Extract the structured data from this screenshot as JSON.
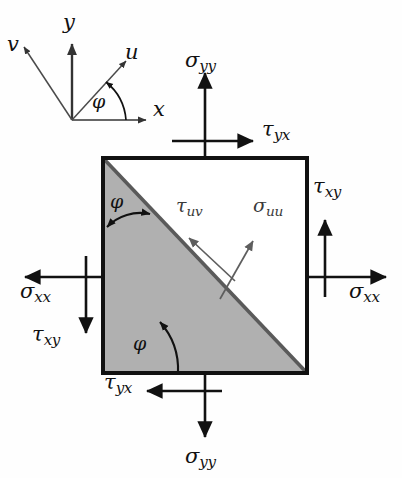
{
  "figure": {
    "type": "stress-element-diagram",
    "colors": {
      "outline": "#111111",
      "shaded_triangle": "#b0b0b0",
      "diagonal": "#5a5a5a",
      "inner_arrow": "#5e5e5e",
      "inner_text": "#3a3a3a",
      "axes": "#4a4a4a",
      "background": "#fefefe"
    },
    "element": {
      "square": {
        "x": 103,
        "y": 158,
        "width": 204,
        "height": 215
      },
      "diagonal_note": "from top-left corner to bottom-right corner",
      "shaded_half": "lower-left"
    }
  },
  "axes_inset": {
    "origin": {
      "x": 72,
      "y": 120
    },
    "labels": {
      "x": "x",
      "y": "y",
      "u": "u",
      "v": "v",
      "angle": "φ"
    }
  },
  "stress_labels": {
    "sigma_yy_top": {
      "base": "σ",
      "sub": "yy"
    },
    "sigma_yy_bottom": {
      "base": "σ",
      "sub": "yy"
    },
    "sigma_xx_left": {
      "base": "σ",
      "sub": "xx"
    },
    "sigma_xx_right": {
      "base": "σ",
      "sub": "xx"
    },
    "tau_yx_top": {
      "base": "τ",
      "sub": "yx"
    },
    "tau_yx_bottom": {
      "base": "τ",
      "sub": "yx"
    },
    "tau_xy_left": {
      "base": "τ",
      "sub": "xy"
    },
    "tau_xy_right": {
      "base": "τ",
      "sub": "xy"
    },
    "tau_uv": {
      "base": "τ",
      "sub": "uv"
    },
    "sigma_uu": {
      "base": "σ",
      "sub": "uu"
    }
  },
  "angle_markers": {
    "upper_phi": "φ",
    "lower_phi": "φ"
  }
}
